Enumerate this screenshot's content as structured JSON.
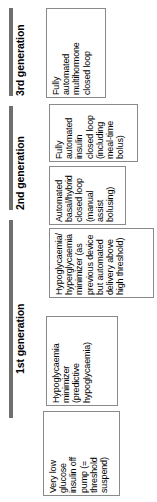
{
  "figure": {
    "orientation": "rotated-90-counterclockwise",
    "bar_color": "#6f6f6f",
    "box_border_color": "#8a8a8a",
    "background_color": "#ffffff"
  },
  "generations": [
    {
      "id": "gen3",
      "label": "3rd generation",
      "stages": [
        {
          "id": "gen3-stage1",
          "name": "fully-automated-multihormone-closed-loop",
          "lines": [
            "Fully",
            "automated",
            "multihormone",
            "closed loop"
          ]
        }
      ]
    },
    {
      "id": "gen2",
      "label": "2nd generation",
      "stages": [
        {
          "id": "gen2-stage2",
          "name": "fully-automated-insulin-closed-loop",
          "lines": [
            "Fully",
            "automated",
            "insulin",
            "closed loop",
            "(including",
            "meal-time",
            "bolus)"
          ]
        },
        {
          "id": "gen2-stage1",
          "name": "automated-basal-hybrid-closed-loop",
          "lines": [
            "Automated",
            "basal/hybrid",
            "closed loop",
            "(manual",
            "assist",
            "bolusing)"
          ]
        }
      ]
    },
    {
      "id": "gen1",
      "label": "1st generation",
      "stages": [
        {
          "id": "gen1-stage3",
          "name": "hypo-hyperglycaemia-minimizer",
          "lines": [
            "Hypoglycaemia/",
            "hyperglycaemia",
            "minimizer (as",
            "previous device",
            "but automated",
            "delivery above",
            "high threshold)"
          ]
        },
        {
          "id": "gen1-stage2",
          "name": "hypoglycaemia-minimizer",
          "lines": [
            "Hypoglycaemia",
            "minimizer",
            "(predictive",
            "hypoglycaemia)"
          ]
        },
        {
          "id": "gen1-stage1",
          "name": "very-low-glucose-insulin-off-pump",
          "lines": [
            "Very low",
            "glucose",
            "insulin off",
            "pump (=",
            "threshold",
            "suspend)"
          ]
        }
      ]
    }
  ]
}
